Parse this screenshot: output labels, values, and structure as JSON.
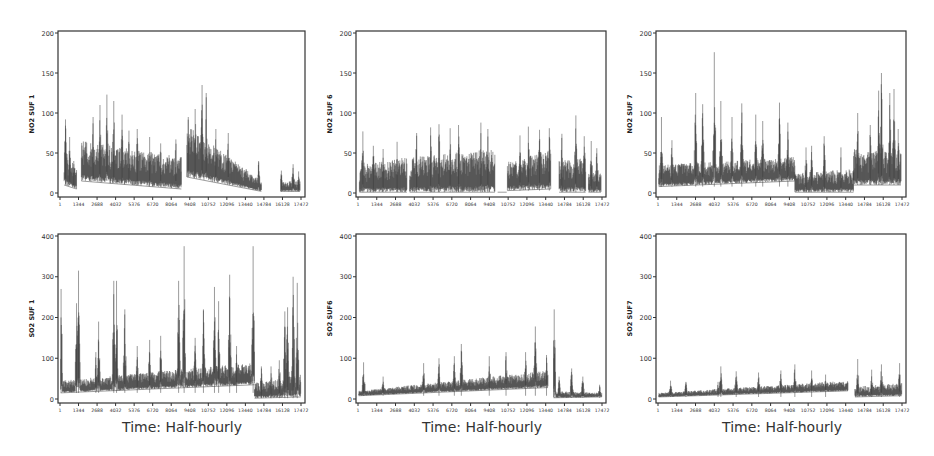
{
  "figure": {
    "x_title": "Time: Half-hourly",
    "line_color": "#3a3a3a",
    "axis_color": "#333333"
  },
  "chart_data": [
    {
      "id": "no2-suf1",
      "type": "line",
      "title": "",
      "xlabel": "",
      "ylabel": "NO2 SUF 1",
      "ylim": [
        0,
        200
      ],
      "yticks": [
        0,
        50,
        100,
        150,
        200
      ],
      "xlim": [
        1,
        17472
      ],
      "xticks": [
        1,
        1344,
        2688,
        4032,
        5376,
        6720,
        8064,
        9408,
        10752,
        12096,
        13440,
        14784,
        16128,
        17472
      ],
      "grid": false,
      "envelope": {
        "segments": [
          {
            "x": [
              300,
              1200
            ],
            "base": [
              10,
              5
            ],
            "top": [
              55,
              30
            ],
            "peaks": [
              [
                400,
                92
              ],
              [
                700,
                70
              ],
              [
                1000,
                40
              ]
            ]
          },
          {
            "x": [
              1550,
              8800
            ],
            "base": [
              15,
              5
            ],
            "top": [
              65,
              45
            ],
            "peaks": [
              [
                2400,
                95
              ],
              [
                2900,
                110
              ],
              [
                3400,
                123
              ],
              [
                3900,
                115
              ],
              [
                4500,
                98
              ],
              [
                5000,
                78
              ],
              [
                5600,
                80
              ],
              [
                6500,
                70
              ],
              [
                7300,
                62
              ],
              [
                8400,
                67
              ]
            ]
          },
          {
            "x": [
              9200,
              14600
            ],
            "base": [
              20,
              2
            ],
            "top": [
              85,
              15
            ],
            "peaks": [
              [
                9300,
                95
              ],
              [
                9800,
                105
              ],
              [
                10300,
                135
              ],
              [
                10600,
                125
              ],
              [
                11300,
                80
              ],
              [
                12200,
                75
              ],
              [
                13500,
                30
              ],
              [
                14400,
                40
              ]
            ]
          },
          {
            "x": [
              16000,
              17400
            ],
            "base": [
              2,
              2
            ],
            "top": [
              15,
              15
            ],
            "peaks": [
              [
                16050,
                28
              ],
              [
                16900,
                36
              ],
              [
                17300,
                27
              ]
            ]
          }
        ]
      }
    },
    {
      "id": "no2-suf6",
      "type": "line",
      "ylabel": "NO2 SUF 6",
      "ylim": [
        0,
        200
      ],
      "yticks": [
        0,
        50,
        100,
        150,
        200
      ],
      "xlim": [
        1,
        17472
      ],
      "xticks": [
        1,
        1344,
        2688,
        4032,
        5376,
        6720,
        8064,
        9408,
        10752,
        12096,
        13440,
        14784,
        16128,
        17472
      ],
      "grid": false,
      "envelope": {
        "segments": [
          {
            "x": [
              100,
              3500
            ],
            "base": [
              1,
              1
            ],
            "top": [
              35,
              45
            ],
            "peaks": [
              [
                350,
                77
              ],
              [
                1100,
                59
              ],
              [
                1800,
                55
              ],
              [
                2800,
                64
              ]
            ]
          },
          {
            "x": [
              3700,
              9800
            ],
            "base": [
              1,
              1
            ],
            "top": [
              45,
              55
            ],
            "peaks": [
              [
                4200,
                75
              ],
              [
                5200,
                82
              ],
              [
                5800,
                86
              ],
              [
                6600,
                81
              ],
              [
                7200,
                85
              ],
              [
                8800,
                88
              ],
              [
                9300,
                80
              ]
            ]
          },
          {
            "x": [
              10000,
              10650
            ],
            "base": [
              1,
              1
            ],
            "top": [
              1,
              1
            ],
            "peaks": []
          },
          {
            "x": [
              10700,
              13800
            ],
            "base": [
              3,
              5
            ],
            "top": [
              40,
              55
            ],
            "peaks": [
              [
                11600,
                72
              ],
              [
                12200,
                83
              ],
              [
                13000,
                79
              ],
              [
                13700,
                81
              ]
            ]
          },
          {
            "x": [
              14400,
              16300
            ],
            "base": [
              1,
              1
            ],
            "top": [
              40,
              45
            ],
            "peaks": [
              [
                14600,
                74
              ],
              [
                15600,
                97
              ],
              [
                16200,
                71
              ]
            ]
          },
          {
            "x": [
              16500,
              17400
            ],
            "base": [
              1,
              1
            ],
            "top": [
              25,
              25
            ],
            "peaks": [
              [
                16700,
                65
              ],
              [
                17100,
                56
              ]
            ]
          }
        ]
      }
    },
    {
      "id": "no2-suf7",
      "type": "line",
      "ylabel": "NO2 SUF 7",
      "ylim": [
        0,
        200
      ],
      "yticks": [
        0,
        50,
        100,
        150,
        200
      ],
      "xlim": [
        1,
        17472
      ],
      "xticks": [
        1,
        1344,
        2688,
        4032,
        5376,
        6720,
        8064,
        9408,
        10752,
        12096,
        13440,
        14784,
        16128,
        17472
      ],
      "grid": false,
      "envelope": {
        "segments": [
          {
            "x": [
              50,
              9800
            ],
            "base": [
              8,
              15
            ],
            "top": [
              35,
              45
            ],
            "peaks": [
              [
                250,
                95
              ],
              [
                1000,
                66
              ],
              [
                2700,
                125
              ],
              [
                3200,
                111
              ],
              [
                4032,
                176
              ],
              [
                4500,
                115
              ],
              [
                5300,
                95
              ],
              [
                6000,
                112
              ],
              [
                7000,
                98
              ],
              [
                7500,
                90
              ],
              [
                8700,
                113
              ],
              [
                9300,
                88
              ]
            ]
          },
          {
            "x": [
              9800,
              14000
            ],
            "base": [
              1,
              1
            ],
            "top": [
              25,
              30
            ],
            "peaks": [
              [
                10600,
                57
              ],
              [
                11000,
                59
              ],
              [
                11900,
                71
              ],
              [
                13100,
                57
              ]
            ]
          },
          {
            "x": [
              14000,
              17400
            ],
            "base": [
              10,
              10
            ],
            "top": [
              55,
              50
            ],
            "peaks": [
              [
                14300,
                100
              ],
              [
                15200,
                85
              ],
              [
                15800,
                128
              ],
              [
                16000,
                150
              ],
              [
                16600,
                125
              ],
              [
                16900,
                130
              ],
              [
                17200,
                80
              ]
            ]
          }
        ]
      }
    },
    {
      "id": "so2-suf1",
      "type": "line",
      "ylabel": "SO2 SUF 1",
      "ylim": [
        0,
        400
      ],
      "yticks": [
        0,
        100,
        200,
        300,
        400
      ],
      "xlim": [
        1,
        17472
      ],
      "xticks": [
        1,
        1344,
        2688,
        4032,
        5376,
        6720,
        8064,
        9408,
        10752,
        12096,
        13440,
        14784,
        16128,
        17472
      ],
      "grid": false,
      "envelope": {
        "segments": [
          {
            "x": [
              50,
              14100
            ],
            "base": [
              15,
              35
            ],
            "top": [
              45,
              90
            ],
            "peaks": [
              [
                80,
                270
              ],
              [
                1200,
                235
              ],
              [
                1344,
                315
              ],
              [
                2600,
                115
              ],
              [
                2800,
                190
              ],
              [
                3900,
                290
              ],
              [
                4100,
                290
              ],
              [
                4700,
                220
              ],
              [
                5600,
                130
              ],
              [
                6500,
                145
              ],
              [
                7300,
                155
              ],
              [
                8600,
                290
              ],
              [
                9000,
                375
              ],
              [
                9800,
                150
              ],
              [
                10400,
                220
              ],
              [
                11200,
                275
              ],
              [
                11500,
                240
              ],
              [
                12300,
                305
              ],
              [
                12800,
                130
              ],
              [
                14000,
                375
              ]
            ]
          },
          {
            "x": [
              14100,
              17450
            ],
            "base": [
              2,
              5
            ],
            "top": [
              40,
              60
            ],
            "peaks": [
              [
                14600,
                80
              ],
              [
                15300,
                80
              ],
              [
                15900,
                95
              ],
              [
                16300,
                215
              ],
              [
                16500,
                225
              ],
              [
                16900,
                300
              ],
              [
                17200,
                285
              ]
            ]
          }
        ]
      }
    },
    {
      "id": "so2-suf6",
      "type": "line",
      "ylabel": "SO2 SUF6",
      "ylim": [
        0,
        400
      ],
      "yticks": [
        0,
        100,
        200,
        300,
        400
      ],
      "xlim": [
        1,
        17472
      ],
      "xticks": [
        1,
        1344,
        2688,
        4032,
        5376,
        6720,
        8064,
        9408,
        10752,
        12096,
        13440,
        14784,
        16128,
        17472
      ],
      "grid": false,
      "envelope": {
        "segments": [
          {
            "x": [
              50,
              13600
            ],
            "base": [
              8,
              28
            ],
            "top": [
              20,
              70
            ],
            "peaks": [
              [
                400,
                90
              ],
              [
                1800,
                55
              ],
              [
                4700,
                88
              ],
              [
                5800,
                100
              ],
              [
                6900,
                105
              ],
              [
                7400,
                135
              ],
              [
                9400,
                105
              ],
              [
                10600,
                115
              ],
              [
                12000,
                115
              ],
              [
                12700,
                178
              ],
              [
                13500,
                108
              ]
            ]
          },
          {
            "x": [
              14000,
              17450
            ],
            "base": [
              3,
              5
            ],
            "top": [
              20,
              15
            ],
            "peaks": [
              [
                14050,
                220
              ],
              [
                14400,
                55
              ],
              [
                15300,
                75
              ],
              [
                16100,
                55
              ],
              [
                17300,
                35
              ]
            ]
          }
        ]
      }
    },
    {
      "id": "so2-suf7",
      "type": "line",
      "ylabel": "SO2 SUF7",
      "ylim": [
        0,
        400
      ],
      "yticks": [
        0,
        100,
        200,
        300,
        400
      ],
      "xlim": [
        1,
        17472
      ],
      "xticks": [
        1,
        1344,
        2688,
        4032,
        5376,
        6720,
        8064,
        9408,
        10752,
        12096,
        13440,
        14784,
        16128,
        17472
      ],
      "grid": false,
      "envelope": {
        "segments": [
          {
            "x": [
              50,
              13600
            ],
            "base": [
              5,
              20
            ],
            "top": [
              15,
              45
            ],
            "peaks": [
              [
                900,
                45
              ],
              [
                2000,
                42
              ],
              [
                4300,
                42
              ],
              [
                4500,
                80
              ],
              [
                5600,
                68
              ],
              [
                7200,
                65
              ],
              [
                8800,
                70
              ],
              [
                9800,
                85
              ],
              [
                11000,
                70
              ],
              [
                12000,
                60
              ]
            ]
          },
          {
            "x": [
              14100,
              17450
            ],
            "base": [
              5,
              8
            ],
            "top": [
              30,
              40
            ],
            "peaks": [
              [
                14300,
                98
              ],
              [
                15300,
                72
              ],
              [
                16000,
                85
              ],
              [
                17300,
                88
              ]
            ]
          }
        ]
      }
    }
  ]
}
